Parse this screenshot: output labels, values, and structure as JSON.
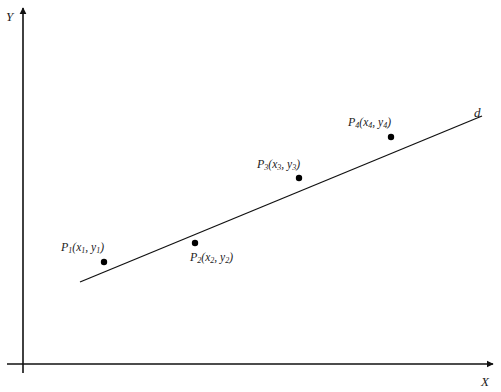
{
  "diagram": {
    "type": "scatter-with-regression-line",
    "axes": {
      "x_label": "X",
      "y_label": "Y"
    },
    "line": {
      "label": "d",
      "from": [
        80,
        282
      ],
      "to": [
        482,
        116
      ]
    },
    "points": [
      {
        "name": "P",
        "index": "1",
        "x_var": "x",
        "y_var": "y",
        "sub": "1",
        "px": [
          104,
          262
        ]
      },
      {
        "name": "P",
        "index": "2",
        "x_var": "x",
        "y_var": "y",
        "sub": "2",
        "px": [
          195,
          243
        ]
      },
      {
        "name": "P",
        "index": "3",
        "x_var": "x",
        "y_var": "y",
        "sub": "3",
        "px": [
          299,
          178
        ]
      },
      {
        "name": "P",
        "index": "4",
        "x_var": "x",
        "y_var": "y",
        "sub": "4",
        "px": [
          391,
          137
        ]
      }
    ],
    "colors": {
      "stroke": "#111111",
      "background": "#ffffff"
    }
  }
}
